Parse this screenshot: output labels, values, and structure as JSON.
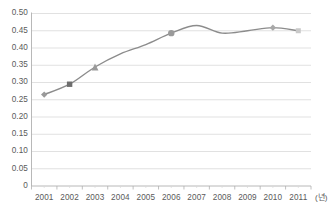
{
  "chart_data": {
    "type": "line",
    "title": "",
    "subtitle": "",
    "xlabel": "(년)",
    "ylabel": "",
    "categories": [
      "2001",
      "2002",
      "2003",
      "2004",
      "2005",
      "2006",
      "2007",
      "2008",
      "2009",
      "2010",
      "2011"
    ],
    "x": [
      2001,
      2002,
      2003,
      2004,
      2005,
      2006,
      2007,
      2008,
      2009,
      2010,
      2011
    ],
    "values": [
      0.265,
      0.295,
      0.345,
      0.383,
      0.41,
      0.443,
      0.465,
      0.443,
      0.45,
      0.459,
      0.45
    ],
    "series": [
      {
        "name": "",
        "values": [
          0.265,
          0.295,
          0.345,
          0.383,
          0.41,
          0.443,
          0.465,
          0.443,
          0.45,
          0.459,
          0.45
        ]
      }
    ],
    "ylim": [
      0,
      0.5
    ],
    "ytick_labels": [
      "0.50",
      "0.45",
      "0.40",
      "0.35",
      "0.30",
      "0.25",
      "0.20",
      "0.15",
      "0.10",
      "0.05",
      "0"
    ],
    "ytick_values": [
      0.5,
      0.45,
      0.4,
      0.35,
      0.3,
      0.25,
      0.2,
      0.15,
      0.1,
      0.05,
      0
    ],
    "grid": true,
    "grid_axis": "y",
    "legend": false,
    "legend_position": "none",
    "smooth": true,
    "markers": [
      {
        "category": "2001",
        "shape": "diamond",
        "value": 0.265
      },
      {
        "category": "2002",
        "shape": "square",
        "value": 0.295
      },
      {
        "category": "2003",
        "shape": "triangle",
        "value": 0.345
      },
      {
        "category": "2006",
        "shape": "circle",
        "value": 0.443
      },
      {
        "category": "2010",
        "shape": "diamond",
        "value": 0.459
      },
      {
        "category": "2011",
        "shape": "square",
        "value": 0.45
      }
    ],
    "colors": {
      "line": "#8c8c8c",
      "marker": "#9a9a9a",
      "marker_dark": "#6e6e6e",
      "marker_light": "#c9c9c9",
      "grid": "#d9d9d9",
      "axis": "#b0b0b0",
      "text": "#5a5a5a",
      "background": "#ffffff"
    }
  }
}
